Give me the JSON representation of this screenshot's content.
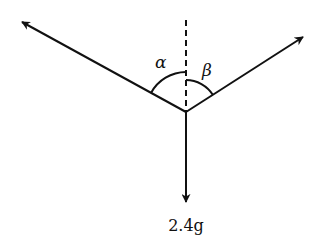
{
  "diagram": {
    "type": "force-diagram",
    "labels": {
      "alpha": "α",
      "beta": "β",
      "weight": "2.4g"
    },
    "forces": [
      {
        "name": "left-tension",
        "direction": "up-left"
      },
      {
        "name": "right-tension",
        "direction": "up-right"
      },
      {
        "name": "weight",
        "direction": "down",
        "label": "2.4g"
      }
    ],
    "reference_line": "vertical-dashed"
  }
}
